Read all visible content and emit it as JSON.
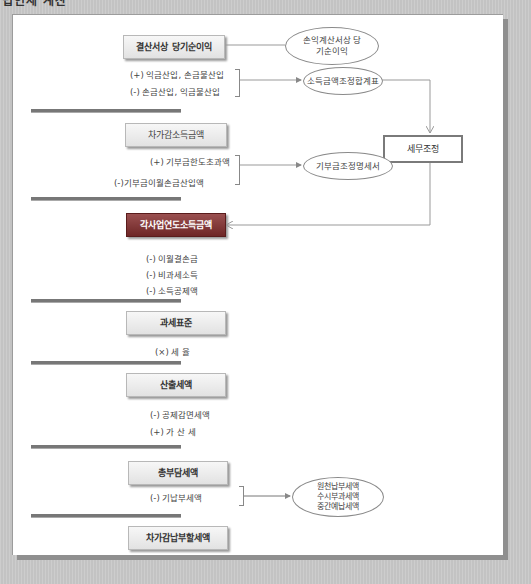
{
  "heading": "법인세 계산",
  "diagram": {
    "boxes": {
      "net_income": "결산서상 당기순이익",
      "adjusted_income": "차가감소득금액",
      "business_year_income": "각사업연도소득금액",
      "tax_base": "과세표준",
      "calculated_tax": "산출세액",
      "total_tax_burden": "총부담세액",
      "tax_payable": "차가감납부할세액",
      "tax_adjustment": "세무조정"
    },
    "items": {
      "income_add": "(+) 익금산입, 손금불산입",
      "income_sub": "(-) 손금산입, 익금불산입",
      "donation_excess": "(+) 기부금한도초과액",
      "donation_carryover": "(-)기부금이월손금산입액",
      "loss_carryover": "(-) 이월결손금",
      "nontaxable": "(-) 비과세소득",
      "income_deduction": "(-) 소득공제액",
      "tax_rate": "(×) 세        율",
      "tax_credit": "(-) 공제감면세액",
      "penalty_tax": "(+) 가    산    세",
      "prepaid_tax": "(-) 기납부세액"
    },
    "ellipses": {
      "income_statement": [
        "손익계산서상 당",
        "기순이익"
      ],
      "adjustment_statement": [
        "소득금액조정합계표"
      ],
      "donation_statement": [
        "기부금조정명세서"
      ],
      "prepaid_detail": [
        "원천납부세액",
        "수시부과세액",
        "중간예납세액"
      ]
    }
  },
  "colors": {
    "dark_box": "#7a2e2e",
    "frame_shadow": "#8f8f8f",
    "background": "#c9c9c9"
  }
}
